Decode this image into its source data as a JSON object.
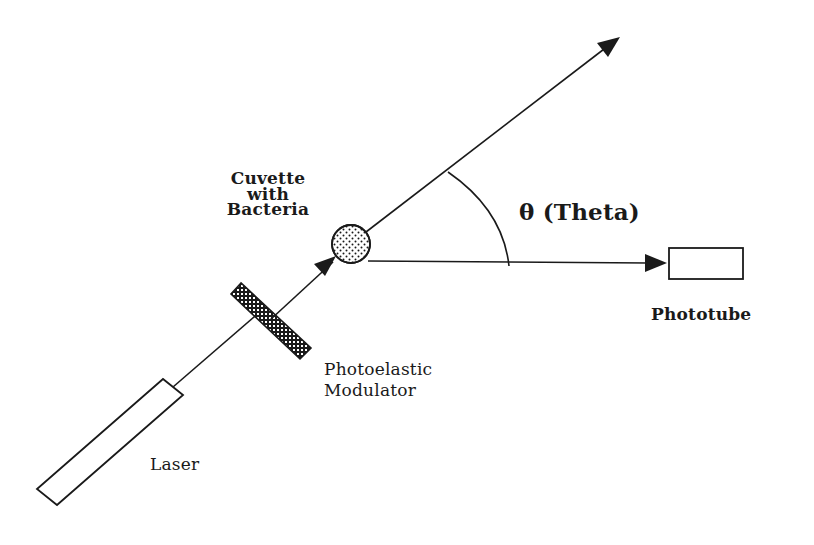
{
  "diagram": {
    "type": "optical-setup-schematic",
    "colors": {
      "stroke": "#1a1a1a",
      "background": "#ffffff"
    },
    "components": [
      {
        "id": "laser",
        "label": "Laser",
        "shape": "rotated-rectangle"
      },
      {
        "id": "modulator",
        "label_lines": [
          "Photoelastic",
          "Modulator"
        ],
        "shape": "hatched-bar"
      },
      {
        "id": "cuvette",
        "label_lines": [
          "Cuvette",
          "with",
          "Bacteria"
        ],
        "shape": "stippled-circle"
      },
      {
        "id": "phototube",
        "label": "Phototube",
        "shape": "rectangle"
      }
    ],
    "angle": {
      "symbol": "θ",
      "label": "θ (Theta)"
    },
    "labels": {
      "cuvette_line1": "Cuvette",
      "cuvette_line2": "with",
      "cuvette_line3": "Bacteria",
      "theta": "θ (Theta)",
      "phototube": "Phototube",
      "modulator_line1": "Photoelastic",
      "modulator_line2": "Modulator",
      "laser": "Laser"
    },
    "edges": [
      {
        "from": "laser",
        "to": "modulator",
        "style": "line"
      },
      {
        "from": "modulator",
        "to": "cuvette",
        "style": "arrow"
      },
      {
        "from": "cuvette",
        "to": "transmitted-beam",
        "style": "arrow"
      },
      {
        "from": "cuvette",
        "to": "phototube",
        "style": "arrow",
        "label": "scattered light at angle θ"
      }
    ]
  }
}
